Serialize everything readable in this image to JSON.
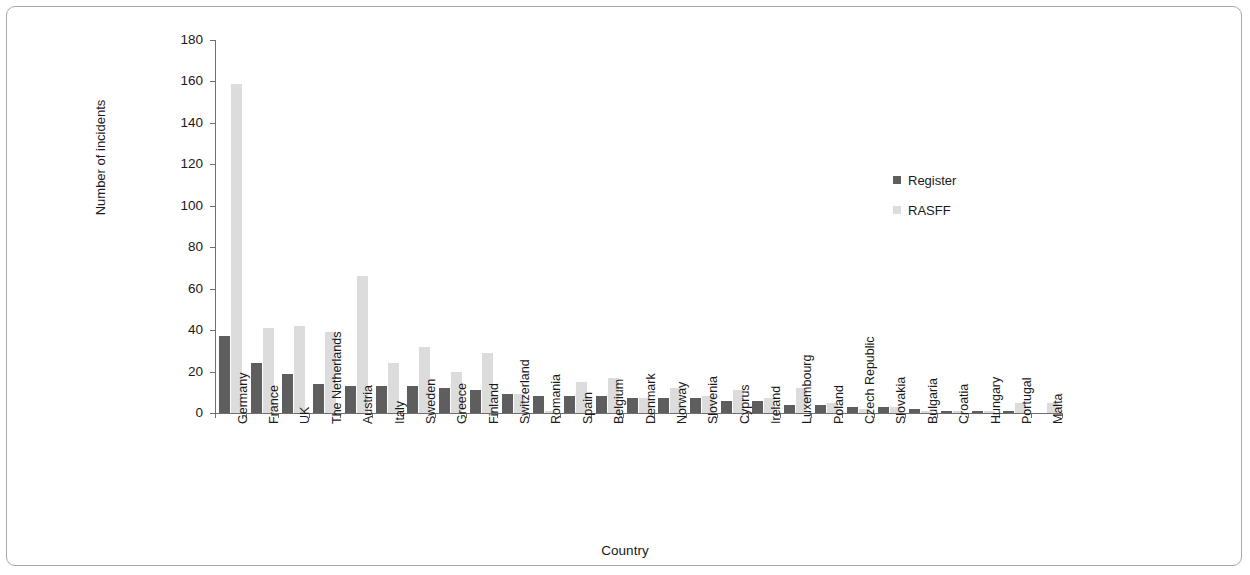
{
  "chart_data": {
    "type": "bar",
    "title": "",
    "xlabel": "Country",
    "ylabel": "Number of incidents",
    "ylim": [
      0,
      180
    ],
    "yticks": [
      0,
      20,
      40,
      60,
      80,
      100,
      120,
      140,
      160,
      180
    ],
    "grid": false,
    "legend_position": "right",
    "categories": [
      "Germany",
      "France",
      "UK",
      "The Netherlands",
      "Austria",
      "Italy",
      "Sweden",
      "Greece",
      "Finland",
      "Switzerland",
      "Romania",
      "Spain",
      "Belgium",
      "Denmark",
      "Norway",
      "Slovenia",
      "Cyprus",
      "Ireland",
      "Luxembourg",
      "Poland",
      "Czech Republic",
      "Slovakia",
      "Bulgaria",
      "Croatia",
      "Hungary",
      "Portugal",
      "Malta"
    ],
    "series": [
      {
        "name": "Register",
        "color": "#5e5e5e",
        "values": [
          37,
          24,
          19,
          14,
          13,
          13,
          13,
          12,
          11,
          9,
          8,
          8,
          8,
          7,
          7,
          7,
          6,
          6,
          4,
          4,
          3,
          3,
          2,
          1,
          1,
          1,
          0
        ]
      },
      {
        "name": "RASFF",
        "color": "#dcdcdc",
        "values": [
          159,
          41,
          42,
          39,
          66,
          24,
          32,
          20,
          29,
          9,
          1,
          15,
          17,
          7,
          12,
          8,
          11,
          7,
          12,
          5,
          2,
          3,
          1,
          1,
          1,
          5,
          5
        ]
      }
    ]
  },
  "legend": {
    "items": [
      {
        "label": "Register",
        "color": "#5e5e5e"
      },
      {
        "label": "RASFF",
        "color": "#dcdcdc"
      }
    ]
  },
  "axes": {
    "y_title": "Number of incidents",
    "x_title": "Country",
    "y_tick_labels": [
      "180",
      "160",
      "140",
      "120",
      "100",
      "80",
      "60",
      "40",
      "20",
      "0"
    ]
  }
}
